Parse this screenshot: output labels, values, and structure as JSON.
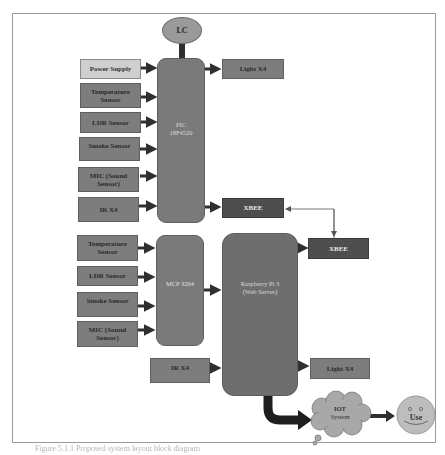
{
  "diagram": {
    "top_section": {
      "lc": "LC",
      "microcontroller": {
        "line1": "PIC",
        "line2": "18F4520"
      },
      "inputs": [
        {
          "label": "Power Supply"
        },
        {
          "label": "Temperature Sensor"
        },
        {
          "label": "LDR Sensor"
        },
        {
          "label": "Smoke Sensor"
        },
        {
          "label": "MIC (Sound Sensor)"
        },
        {
          "label": "IR X4"
        }
      ],
      "outputs": [
        {
          "label": "Light X4"
        },
        {
          "label": "XBEE"
        }
      ]
    },
    "bottom_section": {
      "adc": "MCP 3204",
      "server": {
        "line1": "Raspberry Pi 3",
        "line2": "(Web Server)"
      },
      "inputs": [
        {
          "label": "Temperature Sensor"
        },
        {
          "label": "LDR Sensor"
        },
        {
          "label": "Smoke Sensor"
        },
        {
          "label": "MIC (Sound Sensor)"
        }
      ],
      "ir": "IR X4",
      "outputs": [
        {
          "label": "XBEE"
        },
        {
          "label": "Light X4"
        }
      ],
      "cloud": {
        "line1": "IOT",
        "line2": "System"
      },
      "user": "Use"
    },
    "caption": "Figure 5.1.1 Proposed system layout block diagram"
  },
  "colors": {
    "box_fill": "#7d7d7d",
    "power_fill": "#cfcfcf",
    "xbee_fill": "#4e4e4e",
    "arrow": "#2f2f2f",
    "frame": "#9a9a9a"
  }
}
